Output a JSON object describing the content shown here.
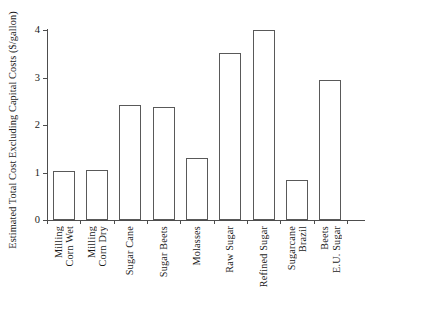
{
  "chart_data": {
    "type": "bar",
    "title": "",
    "xlabel": "",
    "ylabel": "Estimated Total Cost Excluding Capital Costs ($/gallon)",
    "ylim": [
      0,
      4
    ],
    "yticks": [
      "0",
      "1",
      "2",
      "3",
      "4"
    ],
    "ytick_values": [
      0,
      1,
      2,
      3,
      4
    ],
    "grid": false,
    "legend": null,
    "categories": [
      "Corn Wet Milling",
      "Corn Dry Milling",
      "Sugar Cane",
      "Sugar Beets",
      "Molasses",
      "Raw Sugar",
      "Refined Sugar",
      "Brazil Sugarcane",
      "E.U. Sugar Beets"
    ],
    "category_lines": [
      [
        "Corn Wet",
        "Milling"
      ],
      [
        "Corn Dry",
        "Milling"
      ],
      [
        "Sugar Cane"
      ],
      [
        "Sugar Beets"
      ],
      [
        "Molasses"
      ],
      [
        "Raw Sugar"
      ],
      [
        "Refined Sugar"
      ],
      [
        "Brazil",
        "Sugarcane"
      ],
      [
        "E.U. Sugar",
        "Beets"
      ]
    ],
    "values": [
      1.03,
      1.05,
      2.42,
      2.37,
      1.3,
      3.52,
      4.0,
      0.85,
      2.95
    ],
    "bar_color": "#ffffff",
    "bar_edge_color": "#595959",
    "axis_color": "#4d4d4d"
  }
}
